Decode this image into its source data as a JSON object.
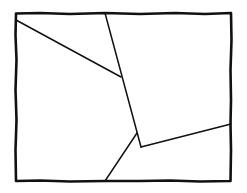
{
  "diagram": {
    "type": "hand-drawn partitioned rectangle",
    "stroke_color": "#111111",
    "background_color": "#ffffff",
    "frame": {
      "x1": 16,
      "y1": 13,
      "x2": 231,
      "y2": 181
    },
    "segments": [
      {
        "id": "line-a",
        "from": [
          16,
          20
        ],
        "to": [
          121,
          77
        ]
      },
      {
        "id": "line-b",
        "from": [
          105,
          13
        ],
        "to": [
          141,
          147
        ]
      },
      {
        "id": "line-c",
        "from": [
          141,
          147
        ],
        "to": [
          231,
          124
        ]
      },
      {
        "id": "line-d",
        "from": [
          137,
          133
        ],
        "to": [
          105,
          181
        ]
      }
    ],
    "regions": 5
  }
}
